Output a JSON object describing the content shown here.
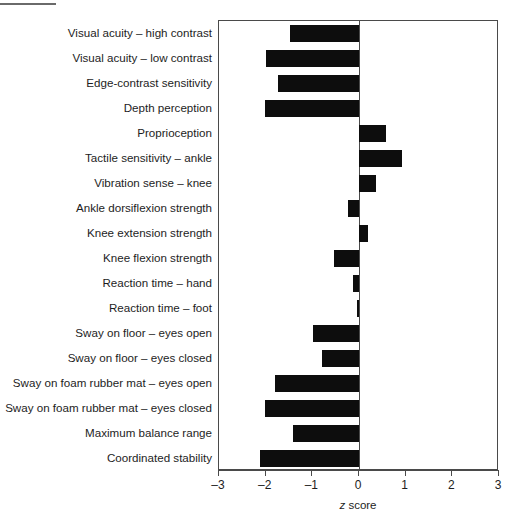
{
  "chart_data": {
    "type": "bar",
    "orientation": "horizontal",
    "title": "",
    "subtitle": "",
    "xlabel": "z score",
    "ylabel": "",
    "xlim": [
      -3,
      3
    ],
    "xticks": [
      -3,
      -2,
      -1,
      0,
      1,
      2,
      3
    ],
    "xtick_labels": [
      "–3",
      "–2",
      "–1",
      "0",
      "1",
      "2",
      "3"
    ],
    "grid": false,
    "legend": null,
    "zero_reference_line": 0,
    "bar_color": "#0d0d0d",
    "frame_color": "#4a4a4a",
    "categories": [
      "Visual acuity – high contrast",
      "Visual acuity – low contrast",
      "Edge-contrast sensitivity",
      "Depth perception",
      "Proprioception",
      "Tactile sensitivity – ankle",
      "Vibration sense – knee",
      "Ankle dorsiflexion strength",
      "Knee extension strength",
      "Knee flexion strength",
      "Reaction time – hand",
      "Reaction time – foot",
      "Sway on floor – eyes open",
      "Sway on floor – eyes closed",
      "Sway on foam rubber mat – eyes open",
      "Sway on foam rubber mat – eyes closed",
      "Maximum balance range",
      "Coordinated stability"
    ],
    "values": [
      -1.48,
      -1.99,
      -1.74,
      -2.01,
      0.58,
      0.92,
      0.36,
      -0.24,
      0.19,
      -0.53,
      -0.13,
      -0.04,
      -0.98,
      -0.8,
      -1.8,
      -2.01,
      -1.41,
      -2.12
    ]
  },
  "axis": {
    "title_prefix": "z",
    "title_suffix": " score"
  }
}
